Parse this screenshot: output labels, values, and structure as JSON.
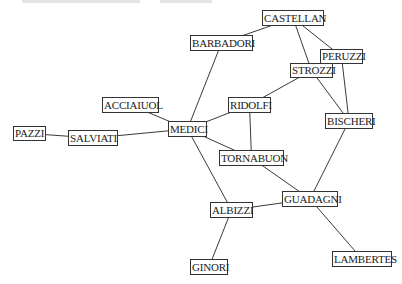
{
  "diagram": {
    "type": "network",
    "nodes": [
      {
        "id": "CASTELLAN",
        "label": "CASTELLAN",
        "x": 262,
        "y": 10,
        "w": 62,
        "h": 16
      },
      {
        "id": "BARBADORI",
        "label": "BARBADORI",
        "x": 190,
        "y": 35,
        "w": 63,
        "h": 16
      },
      {
        "id": "PERUZZI",
        "label": "PERUZZI",
        "x": 320,
        "y": 49,
        "w": 43,
        "h": 15
      },
      {
        "id": "STROZZI",
        "label": "STROZZI",
        "x": 290,
        "y": 63,
        "w": 43,
        "h": 15
      },
      {
        "id": "ACCIAIUOL",
        "label": "ACCIAIUOL",
        "x": 102,
        "y": 97,
        "w": 57,
        "h": 16
      },
      {
        "id": "RIDOLFI",
        "label": "RIDOLFI",
        "x": 228,
        "y": 97,
        "w": 43,
        "h": 16
      },
      {
        "id": "BISCHERI",
        "label": "BISCHERI",
        "x": 325,
        "y": 113,
        "w": 48,
        "h": 16
      },
      {
        "id": "MEDICI",
        "label": "MEDICI",
        "x": 168,
        "y": 121,
        "w": 39,
        "h": 16
      },
      {
        "id": "PAZZI",
        "label": "PAZZI",
        "x": 13,
        "y": 126,
        "w": 33,
        "h": 15
      },
      {
        "id": "SALVIATI",
        "label": "SALVIATI",
        "x": 68,
        "y": 130,
        "w": 50,
        "h": 16
      },
      {
        "id": "TORNABUON",
        "label": "TORNABUON",
        "x": 219,
        "y": 150,
        "w": 65,
        "h": 16
      },
      {
        "id": "GUADAGNI",
        "label": "GUADAGNI",
        "x": 282,
        "y": 191,
        "w": 56,
        "h": 16
      },
      {
        "id": "ALBIZZI",
        "label": "ALBIZZI",
        "x": 210,
        "y": 202,
        "w": 43,
        "h": 16
      },
      {
        "id": "LAMBERTES",
        "label": "LAMBERTES",
        "x": 332,
        "y": 251,
        "w": 60,
        "h": 16
      },
      {
        "id": "GINORI",
        "label": "GINORI",
        "x": 190,
        "y": 259,
        "w": 38,
        "h": 16
      }
    ],
    "edges": [
      [
        "CASTELLAN",
        "BARBADORI"
      ],
      [
        "CASTELLAN",
        "STROZZI"
      ],
      [
        "CASTELLAN",
        "PERUZZI"
      ],
      [
        "PERUZZI",
        "STROZZI"
      ],
      [
        "PERUZZI",
        "BISCHERI"
      ],
      [
        "STROZZI",
        "BISCHERI"
      ],
      [
        "STROZZI",
        "RIDOLFI"
      ],
      [
        "BARBADORI",
        "MEDICI"
      ],
      [
        "ACCIAIUOL",
        "MEDICI"
      ],
      [
        "PAZZI",
        "SALVIATI"
      ],
      [
        "SALVIATI",
        "MEDICI"
      ],
      [
        "MEDICI",
        "RIDOLFI"
      ],
      [
        "MEDICI",
        "TORNABUON"
      ],
      [
        "MEDICI",
        "ALBIZZI"
      ],
      [
        "RIDOLFI",
        "TORNABUON"
      ],
      [
        "TORNABUON",
        "GUADAGNI"
      ],
      [
        "BISCHERI",
        "GUADAGNI"
      ],
      [
        "GUADAGNI",
        "ALBIZZI"
      ],
      [
        "GUADAGNI",
        "LAMBERTES"
      ],
      [
        "ALBIZZI",
        "GINORI"
      ]
    ],
    "colors": {
      "edge": "#3a3a3a",
      "node_border": "#333333",
      "text": "#222222",
      "background": "#ffffff"
    }
  },
  "cropped_caption_strips": [
    {
      "x": 22,
      "w": 118
    },
    {
      "x": 160,
      "w": 52
    }
  ]
}
